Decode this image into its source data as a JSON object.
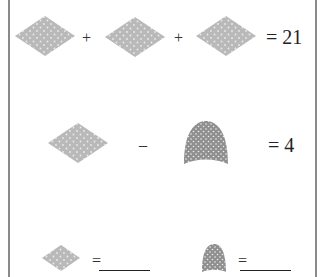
{
  "puzzle": {
    "colors": {
      "diamond_fill": "#b9b9b9",
      "arch_fill": "#8f8f8f",
      "dot": "#ffffff",
      "border": "#8a8a8a"
    },
    "equations": [
      {
        "terms": [
          "diamond-icon",
          "diamond-icon",
          "diamond-icon"
        ],
        "operators": [
          "+",
          "+"
        ],
        "result_label": "= 21"
      },
      {
        "terms": [
          "diamond-icon",
          "arch-icon"
        ],
        "operators": [
          "–"
        ],
        "result_label": "= 4"
      }
    ],
    "answers": [
      {
        "shape": "diamond-icon",
        "equals_label": "=",
        "value": ""
      },
      {
        "shape": "arch-icon",
        "equals_label": "=",
        "value": ""
      }
    ]
  }
}
